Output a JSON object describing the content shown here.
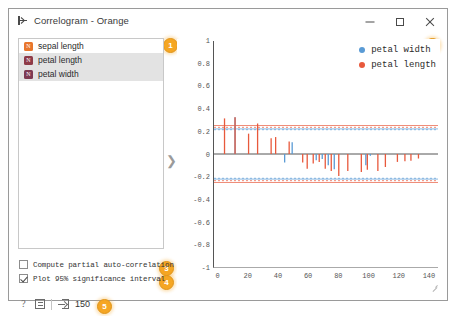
{
  "window": {
    "title": "Correlogram - Orange",
    "dock_icon": "dock-widget-icon",
    "minimize_label": "–",
    "maximize_label": "□",
    "close_label": "✕"
  },
  "badges": [
    {
      "id": "badge-1",
      "label": "1"
    },
    {
      "id": "badge-2",
      "label": "2"
    },
    {
      "id": "badge-3",
      "label": "3"
    },
    {
      "id": "badge-4",
      "label": "4"
    },
    {
      "id": "badge-5",
      "label": "5"
    }
  ],
  "variable_list": {
    "items": [
      {
        "label": "sepal length",
        "chip_letter": "N",
        "chip_color": "#e8762c",
        "selected": false
      },
      {
        "label": "petal length",
        "chip_letter": "N",
        "chip_color": "#8e3b48",
        "selected": true
      },
      {
        "label": "petal width",
        "chip_letter": "N",
        "chip_color": "#7e3a52",
        "selected": true
      }
    ]
  },
  "splitter": {
    "handle": "❯"
  },
  "options": {
    "partial": {
      "label": "Compute partial auto-correlation",
      "checked": false
    },
    "significance": {
      "label": "Plot 95% significance interval",
      "checked": true
    }
  },
  "statusbar": {
    "help_icon": "help-icon",
    "report_icon": "report-icon",
    "input_icon": "input-arrow-icon",
    "input_count": "150"
  },
  "legend": {
    "position": "top-right",
    "entries": [
      {
        "label": "petal width",
        "color": "#5a9bd5"
      },
      {
        "label": "petal length",
        "color": "#e8593c"
      }
    ]
  },
  "chart_data": {
    "type": "bar",
    "title": "",
    "xlabel": "",
    "ylabel": "",
    "xlim": [
      -3,
      146
    ],
    "ylim": [
      -1,
      1
    ],
    "grid": false,
    "xticks": [
      0,
      20,
      40,
      60,
      80,
      100,
      120,
      140
    ],
    "xtick_labels": [
      "0",
      "20",
      "40",
      "60",
      "80",
      "100",
      "120",
      "140"
    ],
    "yticks": [
      1,
      0.8,
      0.6,
      0.4,
      0.2,
      0,
      -0.2,
      -0.4,
      -0.6,
      -0.8,
      -1
    ],
    "ytick_labels": [
      "1",
      "0.8",
      "0.6",
      "0.4",
      "0.2",
      "0",
      "-0.2",
      "-0.4",
      "-0.6",
      "-0.8",
      "-1"
    ],
    "zero_line": 0,
    "significance_lines": [
      {
        "value": 0.252,
        "color": "#e8593c",
        "style": "solid"
      },
      {
        "value": 0.236,
        "color": "#e8593c",
        "style": "dashed"
      },
      {
        "value": 0.222,
        "color": "#5a9bd5",
        "style": "solid"
      },
      {
        "value": 0.215,
        "color": "#5a9bd5",
        "style": "dashed"
      },
      {
        "value": -0.215,
        "color": "#5a9bd5",
        "style": "dashed"
      },
      {
        "value": -0.222,
        "color": "#5a9bd5",
        "style": "solid"
      },
      {
        "value": -0.236,
        "color": "#e8593c",
        "style": "dashed"
      },
      {
        "value": -0.252,
        "color": "#e8593c",
        "style": "solid"
      }
    ],
    "series": [
      {
        "name": "petal length",
        "color": "#e8593c",
        "points": [
          {
            "x": 4,
            "y": 0.315
          },
          {
            "x": 11,
            "y": 0.325
          },
          {
            "x": 20,
            "y": 0.18
          },
          {
            "x": 26,
            "y": 0.27
          },
          {
            "x": 35,
            "y": 0.14
          },
          {
            "x": 38,
            "y": 0.15
          },
          {
            "x": 47,
            "y": 0.11
          },
          {
            "x": 56,
            "y": -0.075
          },
          {
            "x": 59,
            "y": -0.13
          },
          {
            "x": 63,
            "y": -0.085
          },
          {
            "x": 67,
            "y": -0.07
          },
          {
            "x": 71,
            "y": -0.13
          },
          {
            "x": 75,
            "y": -0.15
          },
          {
            "x": 80,
            "y": -0.195
          },
          {
            "x": 86,
            "y": -0.15
          },
          {
            "x": 95,
            "y": -0.16
          },
          {
            "x": 99,
            "y": -0.14
          },
          {
            "x": 106,
            "y": -0.15
          },
          {
            "x": 111,
            "y": -0.115
          },
          {
            "x": 119,
            "y": -0.07
          },
          {
            "x": 124,
            "y": -0.065
          },
          {
            "x": 128,
            "y": -0.06
          },
          {
            "x": 133,
            "y": -0.04
          }
        ]
      },
      {
        "name": "petal width",
        "color": "#5a9bd5",
        "points": [
          {
            "x": 11,
            "y": 0.325
          },
          {
            "x": 44,
            "y": -0.075
          },
          {
            "x": 49,
            "y": 0.105
          },
          {
            "x": 65,
            "y": -0.055
          },
          {
            "x": 69,
            "y": -0.045
          },
          {
            "x": 73,
            "y": -0.1
          },
          {
            "x": 77,
            "y": -0.135
          },
          {
            "x": 98,
            "y": -0.1
          },
          {
            "x": 101,
            "y": -0.015
          }
        ]
      }
    ]
  }
}
